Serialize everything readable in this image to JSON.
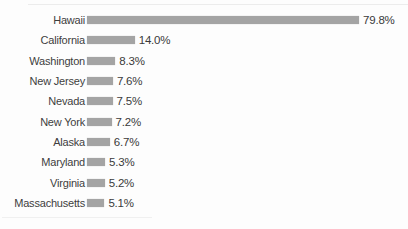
{
  "chart_data": {
    "type": "bar",
    "orientation": "horizontal",
    "title": "",
    "xlabel": "",
    "ylabel": "",
    "grid": false,
    "legend": null,
    "xlim": [
      0,
      83
    ],
    "categories": [
      "Hawaii",
      "California",
      "Washington",
      "New Jersey",
      "Nevada",
      "New York",
      "Alaska",
      "Maryland",
      "Virginia",
      "Massachusetts"
    ],
    "values": [
      79.8,
      14.0,
      8.3,
      7.6,
      7.5,
      7.2,
      6.7,
      5.3,
      5.2,
      5.1
    ],
    "value_labels": [
      "79.8%",
      "14.0%",
      "8.3%",
      "7.6%",
      "7.5%",
      "7.2%",
      "6.7%",
      "5.3%",
      "5.2%",
      "5.1%"
    ]
  },
  "style": {
    "bar_color": "#a4a4a4",
    "label_color": "#3e3e3e",
    "value_color": "#3a3a3a",
    "background": "#fdfdfd",
    "px_per_percent": 3.409
  }
}
